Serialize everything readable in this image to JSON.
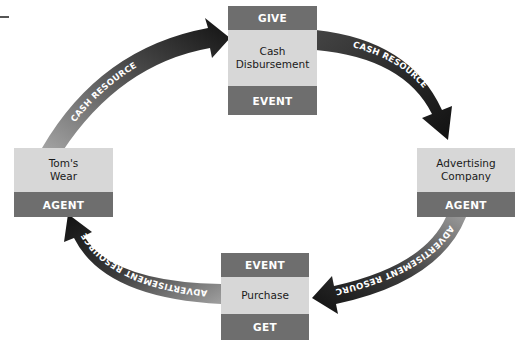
{
  "diagram": {
    "type": "REA exchange cycle",
    "colors": {
      "dark_band": "#6e6e6e",
      "light_band": "#d7d7d7",
      "arrow_start": "#9a9a9a",
      "arrow_end": "#111111",
      "label_text": "#ffffff"
    },
    "nodes": {
      "top": {
        "header": "GIVE",
        "title": "Cash Disbursement",
        "footer": "EVENT"
      },
      "left": {
        "title": "Tom's Wear",
        "footer": "AGENT"
      },
      "right": {
        "title": "Advertising Company",
        "footer": "AGENT"
      },
      "bottom": {
        "header": "EVENT",
        "title": "Purchase",
        "footer": "GET"
      }
    },
    "arrows": [
      {
        "from": "Tom's Wear",
        "to": "Cash Disbursement",
        "label": "CASH  RESOURCE"
      },
      {
        "from": "Cash Disbursement",
        "to": "Advertising Company",
        "label": "CASH  RESOURCE"
      },
      {
        "from": "Advertising Company",
        "to": "Purchase",
        "label": "ADVERTISEMENT RESOURCE"
      },
      {
        "from": "Purchase",
        "to": "Tom's Wear",
        "label": "ADVERTISEMENT RESOURCE"
      }
    ]
  }
}
